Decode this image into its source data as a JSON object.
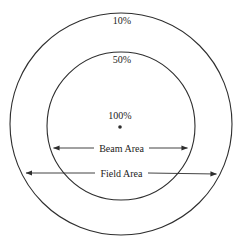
{
  "diagram": {
    "labels": {
      "outer_ring": "10%",
      "inner_ring": "50%",
      "center": "100%",
      "beam_area": "Beam Area",
      "field_area": "Field Area"
    },
    "colors": {
      "line": "#2e2e2e",
      "text": "#1c1c1c",
      "background": "#ffffff"
    }
  }
}
